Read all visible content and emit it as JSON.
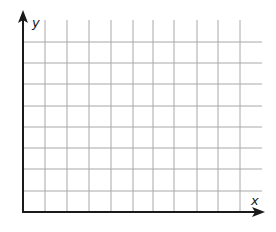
{
  "diagram": {
    "type": "blank-coordinate-grid",
    "x_axis_label": "x",
    "y_axis_label": "y",
    "grid": {
      "columns": 10,
      "rows": 9,
      "vertical_lines_x": [
        45,
        67,
        89,
        111,
        133,
        153,
        174,
        197,
        218,
        240
      ],
      "horizontal_lines_y": [
        42,
        63,
        84,
        106,
        127,
        148,
        169,
        191
      ],
      "top_y": 20,
      "right_x": 262
    },
    "origin": {
      "x": 23,
      "y": 212
    },
    "x_axis_end": 265,
    "y_axis_end": 10,
    "colors": {
      "axis": "#1a1a1a",
      "grid": "#a8a8a8",
      "background": "#ffffff"
    }
  }
}
